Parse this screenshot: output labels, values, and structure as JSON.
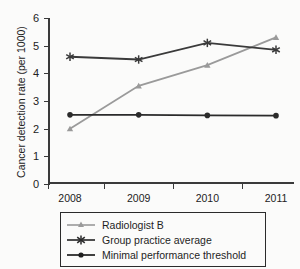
{
  "chart_data": {
    "type": "line",
    "title": "CANCER DETECTION RATE",
    "xlabel": "",
    "ylabel": "Cancer detection rate (per 1000)",
    "categories": [
      "2008",
      "2009",
      "2010",
      "2011"
    ],
    "x_tick_labels": [
      "2008",
      "2009",
      "2010",
      "2011"
    ],
    "y_tick_labels": [
      "0",
      "1",
      "2",
      "3",
      "4",
      "5",
      "6"
    ],
    "y_ticks": [
      0,
      1,
      2,
      3,
      4,
      5,
      6
    ],
    "ylim": [
      0,
      6
    ],
    "grid": false,
    "legend_position": "bottom",
    "series": [
      {
        "name": "Radiologist B",
        "values": [
          2.0,
          3.55,
          4.3,
          5.3
        ],
        "color": "#9a9a9a",
        "marker": "triangle"
      },
      {
        "name": "Group practice average",
        "values": [
          4.6,
          4.5,
          5.1,
          4.85
        ],
        "color": "#3a3a3a",
        "marker": "asterisk"
      },
      {
        "name": "Minimal performance threshold",
        "values": [
          2.5,
          2.5,
          2.48,
          2.47
        ],
        "color": "#2b2b2b",
        "marker": "circle"
      }
    ]
  },
  "legend": {
    "items": [
      {
        "label": "Radiologist B"
      },
      {
        "label": "Group practice average"
      },
      {
        "label": "Minimal performance threshold"
      }
    ]
  }
}
